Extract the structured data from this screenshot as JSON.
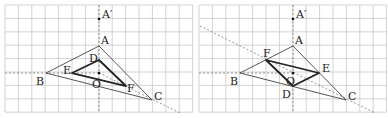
{
  "figures": [
    {
      "id": "left",
      "offset_x": 0,
      "points": {
        "A_prime": {
          "label": "A′",
          "x": 99,
          "y": 19,
          "lx": 102,
          "ly": 18
        },
        "A": {
          "label": "A",
          "x": 99,
          "y": 46,
          "lx": 101,
          "ly": 44
        },
        "B": {
          "label": "B",
          "x": 46,
          "y": 73,
          "lx": 36,
          "ly": 85
        },
        "C": {
          "label": "C",
          "x": 152,
          "y": 100,
          "lx": 154,
          "ly": 100
        },
        "D": {
          "label": "D",
          "x": 99,
          "y": 60,
          "lx": 89,
          "ly": 62
        },
        "E": {
          "label": "E",
          "x": 72,
          "y": 73,
          "lx": 63,
          "ly": 74
        },
        "F": {
          "label": "F",
          "x": 126,
          "y": 86,
          "lx": 127,
          "ly": 92
        },
        "O": {
          "label": "O",
          "x": 99,
          "y": 73,
          "lx": 92,
          "ly": 88
        }
      },
      "inner_triangle": [
        "D",
        "E",
        "F"
      ]
    },
    {
      "id": "right",
      "offset_x": 194,
      "points": {
        "A_prime": {
          "label": "A′",
          "x": 99,
          "y": 19,
          "lx": 102,
          "ly": 18
        },
        "A": {
          "label": "A",
          "x": 99,
          "y": 46,
          "lx": 101,
          "ly": 44
        },
        "B": {
          "label": "B",
          "x": 46,
          "y": 73,
          "lx": 36,
          "ly": 85
        },
        "C": {
          "label": "C",
          "x": 152,
          "y": 100,
          "lx": 154,
          "ly": 100
        },
        "D": {
          "label": "D",
          "x": 99,
          "y": 86,
          "lx": 88,
          "ly": 98
        },
        "E": {
          "label": "E",
          "x": 125,
          "y": 73,
          "lx": 128,
          "ly": 72
        },
        "F": {
          "label": "F",
          "x": 72,
          "y": 60,
          "lx": 69,
          "ly": 57
        },
        "O": {
          "label": "O",
          "x": 99,
          "y": 73,
          "lx": 92,
          "ly": 85
        }
      },
      "inner_triangle": [
        "D",
        "E",
        "F"
      ]
    }
  ],
  "grid": {
    "x0": 5,
    "y0": 5,
    "cell": 13.4,
    "cols": 14,
    "rows": 8
  },
  "colors": {
    "grid": "#c8c8c8",
    "dashed": "#7a7a7a",
    "outer": "#444444",
    "inner": "#222222"
  }
}
